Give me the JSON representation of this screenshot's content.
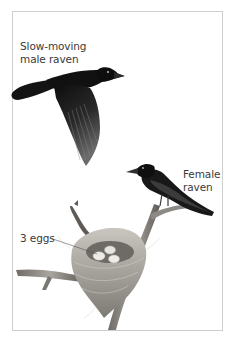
{
  "figure": {
    "labels": {
      "male": {
        "line1": "Slow-moving",
        "line2": "male raven"
      },
      "female": {
        "line1": "Female",
        "line2": "raven"
      },
      "eggs": {
        "text": "3 eggs"
      }
    },
    "colors": {
      "frame_border": "#cfcfcf",
      "label_text": "#3a3a3a",
      "raven_body": "#161616",
      "branch": "#8a8680",
      "nest": "#b8b4ac",
      "egg": "#ecebe6"
    },
    "illustrations": [
      "flying-male-raven",
      "perched-female-raven",
      "nest-with-eggs",
      "branch"
    ]
  }
}
